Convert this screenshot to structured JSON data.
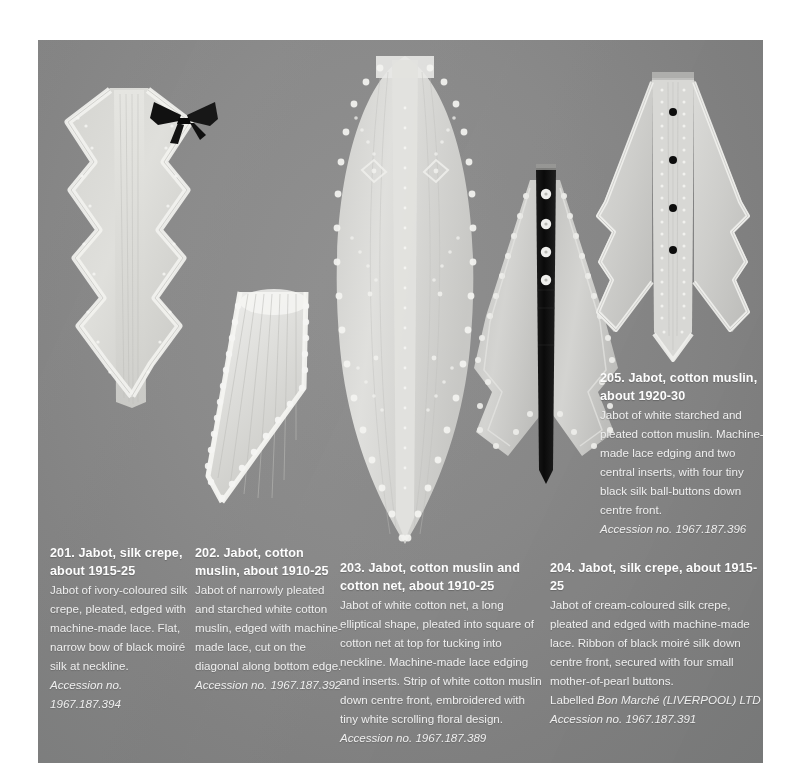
{
  "plate": {
    "background_color": "#8a8a8a",
    "page_color": "#ffffff"
  },
  "objects": [
    {
      "id": "201",
      "name": "jabot-silk-crepe-201",
      "description": "Ivory silk crepe jabot, pleated, zig-zag lace-edged panels, flat narrow black moire silk bow at neckline",
      "has_black_bow": true,
      "button_count": 0
    },
    {
      "id": "202",
      "name": "jabot-cotton-muslin-202",
      "description": "Narrowly pleated starched white cotton muslin jabot cut on the diagonal with scalloped machine-made lace edging",
      "has_black_bow": false,
      "button_count": 0
    },
    {
      "id": "203",
      "name": "jabot-cotton-muslin-and-net-203",
      "description": "Long elliptical white cotton net jabot with machine-made lace edging and inserts, embroidered muslin strip down centre front",
      "has_black_bow": false,
      "button_count": 0
    },
    {
      "id": "204",
      "name": "jabot-silk-crepe-204",
      "description": "Cream silk crepe jabot with black moire silk ribbon down centre front secured with four mother-of-pearl buttons",
      "has_black_bow": false,
      "button_count": 4,
      "button_color": "#ededed",
      "ribbon_color": "#121212"
    },
    {
      "id": "205",
      "name": "jabot-cotton-muslin-205",
      "description": "White starched and pleated cotton muslin jabot, lace edging and two central inserts, four tiny black silk ball-buttons down centre front",
      "has_black_bow": false,
      "button_count": 4,
      "button_color": "#111111"
    }
  ],
  "captions": {
    "c201": {
      "title": "201. Jabot, silk crepe, about 1915-25",
      "body": "Jabot of ivory-coloured silk crepe, pleated, edged with machine-made lace. Flat, narrow bow of black moiré silk at neckline.",
      "accession": "Accession no. 1967.187.394"
    },
    "c202": {
      "title": "202. Jabot, cotton muslin, about 1910-25",
      "body": "Jabot of narrowly pleated and starched white cotton muslin, edged with machine-made lace, cut on the diagonal along bottom edge.",
      "accession": "Accession no. 1967.187.392"
    },
    "c203": {
      "title": "203. Jabot, cotton muslin and cotton net, about 1910-25",
      "body": "Jabot of white cotton net, a long elliptical shape, pleated into square of cotton net at top for tucking into neckline. Machine-made lace edging and inserts. Strip of white cotton muslin down centre front, embroidered with tiny white scrolling floral design.",
      "accession": "Accession no. 1967.187.389"
    },
    "c204": {
      "title": "204. Jabot, silk crepe, about 1915-25",
      "body": "Jabot of cream-coloured silk crepe, pleated and edged with machine-made lace. Ribbon of black moiré silk down centre front, secured with four small mother-of-pearl buttons.",
      "label_prefix": "Labelled ",
      "label_maker": "Bon Marché (LIVERPOOL) LTD",
      "accession": "Accession no. 1967.187.391"
    },
    "c205": {
      "title": "205. Jabot, cotton muslin, about 1920-30",
      "body": "Jabot of white starched and pleated cotton muslin. Machine-made lace edging and two central inserts, with four tiny black silk ball-buttons down centre front.",
      "accession": "Accession no. 1967.187.396"
    }
  }
}
